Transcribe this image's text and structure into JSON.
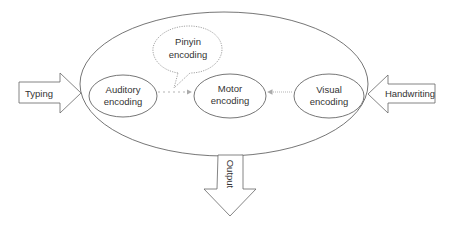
{
  "diagram": {
    "colors": {
      "stroke": "#555555",
      "dotted": "#999999",
      "text": "#333333",
      "background": "#ffffff"
    },
    "outer_container": {
      "shape": "ellipse"
    },
    "inputs": {
      "typing": {
        "label": "Typing",
        "direction": "right"
      },
      "handwriting": {
        "label": "Handwriting",
        "direction": "left"
      }
    },
    "nodes": {
      "auditory": {
        "line1": "Auditory",
        "line2": "encoding"
      },
      "motor": {
        "line1": "Motor",
        "line2": "encoding"
      },
      "visual": {
        "line1": "Visual",
        "line2": "encoding"
      },
      "pinyin": {
        "line1": "Pinyin",
        "line2": "encoding",
        "shape": "thought-bubble"
      }
    },
    "edges": [
      {
        "from": "Auditory encoding",
        "to": "Motor encoding",
        "style": "dotted"
      },
      {
        "from": "Visual encoding",
        "to": "Motor encoding",
        "style": "dotted"
      }
    ],
    "output": {
      "label": "Output",
      "direction": "down"
    }
  }
}
